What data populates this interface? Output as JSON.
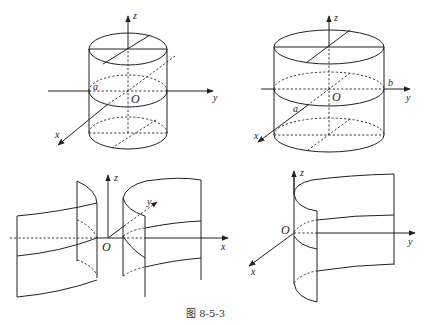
{
  "figure": {
    "caption": "图 8-5-3",
    "panels": [
      {
        "id": "top-left",
        "description": "Circular cylinder along z-axis with radius a",
        "labels": {
          "z": "z",
          "y": "y",
          "x": "x",
          "origin": "O",
          "radius": "a"
        }
      },
      {
        "id": "top-right",
        "description": "Elliptic cylinder along z-axis with semi-axes a and b",
        "labels": {
          "z": "z",
          "y": "y",
          "x": "x",
          "origin": "O",
          "a": "a",
          "b": "b"
        }
      },
      {
        "id": "bottom-left",
        "description": "Hyperbolic cylinder",
        "labels": {
          "z": "z",
          "y": "y",
          "x": "x",
          "origin": "O"
        }
      },
      {
        "id": "bottom-right",
        "description": "Parabolic cylinder",
        "labels": {
          "z": "z",
          "y": "y",
          "x": "x",
          "origin": "O"
        }
      }
    ]
  }
}
